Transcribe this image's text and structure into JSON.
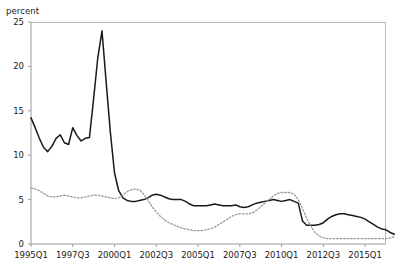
{
  "chart_data": {
    "type": "line",
    "title": "",
    "xlabel": "",
    "ylabel": "percent",
    "ylim": [
      0,
      25
    ],
    "yticks": [
      0,
      5,
      10,
      15,
      20,
      25
    ],
    "grid": false,
    "legend": "none",
    "xtick_labels": [
      "1995Q1",
      "1997Q3",
      "2000Q1",
      "2002Q3",
      "2005Q1",
      "2007Q3",
      "2010Q1",
      "2012Q3",
      "2015Q1"
    ],
    "xtick_positions": [
      0,
      10,
      20,
      30,
      40,
      50,
      60,
      70,
      80
    ],
    "x_index_range": [
      0,
      85
    ],
    "series": [
      {
        "name": "solid-series",
        "style": "solid",
        "color": "#1a1a1a",
        "values": [
          14.2,
          13.1,
          11.9,
          10.9,
          10.4,
          11.0,
          11.9,
          12.3,
          11.4,
          11.2,
          13.1,
          12.2,
          11.6,
          11.9,
          12.0,
          16.4,
          21.0,
          24.0,
          18.2,
          12.6,
          8.0,
          6.0,
          5.2,
          4.9,
          4.8,
          4.8,
          4.9,
          5.0,
          5.2,
          5.5,
          5.6,
          5.5,
          5.3,
          5.1,
          5.0,
          5.0,
          5.0,
          4.8,
          4.5,
          4.3,
          4.3,
          4.3,
          4.3,
          4.4,
          4.5,
          4.4,
          4.3,
          4.3,
          4.3,
          4.4,
          4.2,
          4.1,
          4.2,
          4.4,
          4.6,
          4.7,
          4.8,
          4.9,
          5.0,
          4.9,
          4.8,
          4.9,
          5.0,
          4.8,
          4.6,
          2.6,
          2.1,
          2.1,
          2.1,
          2.2,
          2.4,
          2.8,
          3.1,
          3.3,
          3.4,
          3.4,
          3.3,
          3.2,
          3.1,
          3.0,
          2.8,
          2.5,
          2.2,
          1.9,
          1.7,
          1.6,
          1.3,
          1.1
        ]
      },
      {
        "name": "dotted-series",
        "style": "dotted",
        "color": "#9a9a9a",
        "values": [
          6.3,
          6.2,
          6.0,
          5.7,
          5.4,
          5.3,
          5.3,
          5.4,
          5.5,
          5.4,
          5.3,
          5.2,
          5.2,
          5.3,
          5.4,
          5.5,
          5.5,
          5.4,
          5.3,
          5.2,
          5.1,
          5.2,
          5.5,
          5.9,
          6.1,
          6.2,
          6.1,
          5.6,
          4.9,
          4.2,
          3.6,
          3.1,
          2.7,
          2.4,
          2.2,
          2.0,
          1.8,
          1.7,
          1.6,
          1.5,
          1.5,
          1.5,
          1.6,
          1.7,
          1.9,
          2.2,
          2.5,
          2.8,
          3.1,
          3.3,
          3.4,
          3.4,
          3.4,
          3.5,
          3.8,
          4.2,
          4.6,
          5.0,
          5.4,
          5.7,
          5.8,
          5.8,
          5.8,
          5.6,
          5.0,
          4.0,
          2.9,
          2.0,
          1.3,
          0.9,
          0.7,
          0.6,
          0.6,
          0.6,
          0.6,
          0.6,
          0.6,
          0.6,
          0.6,
          0.6,
          0.6,
          0.6,
          0.6,
          0.6,
          0.6,
          0.6,
          0.7,
          0.8
        ]
      }
    ]
  },
  "axis": {
    "unit_label": "percent"
  }
}
